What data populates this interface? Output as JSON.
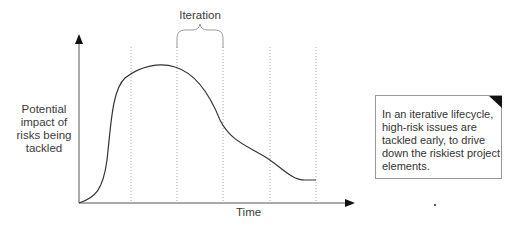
{
  "diagram": {
    "iteration_label": "Iteration",
    "y_axis_label": "Potential impact of risks being tackled",
    "x_axis_label": "Time",
    "note": "In an iterative lifecycle, high-risk issues are tackled early, to drive down the riskiest project elements.",
    "iteration_boundaries_count": 5,
    "curve_description": "Risk impact rises steeply early, peaks, then declines across iterations",
    "colors": {
      "curve": "#333333",
      "axes": "#444444",
      "grid": "#999999",
      "note_border": "#999999"
    }
  }
}
